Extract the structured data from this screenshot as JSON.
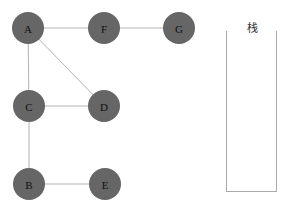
{
  "graph": {
    "node_color": "#666666",
    "edge_color": "#b3b3b3",
    "nodes": [
      {
        "id": "A",
        "label": "A",
        "x": 28,
        "y": 28
      },
      {
        "id": "F",
        "label": "F",
        "x": 104,
        "y": 28
      },
      {
        "id": "G",
        "label": "G",
        "x": 179,
        "y": 28
      },
      {
        "id": "C",
        "label": "C",
        "x": 29,
        "y": 106
      },
      {
        "id": "D",
        "label": "D",
        "x": 104,
        "y": 106
      },
      {
        "id": "B",
        "label": "B",
        "x": 29,
        "y": 184
      },
      {
        "id": "E",
        "label": "E",
        "x": 105,
        "y": 184
      }
    ],
    "edges": [
      [
        "A",
        "F"
      ],
      [
        "F",
        "G"
      ],
      [
        "A",
        "C"
      ],
      [
        "A",
        "D"
      ],
      [
        "C",
        "D"
      ],
      [
        "C",
        "B"
      ],
      [
        "B",
        "E"
      ]
    ]
  },
  "stack": {
    "label": "栈",
    "items": []
  }
}
